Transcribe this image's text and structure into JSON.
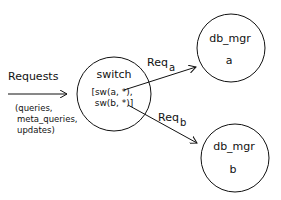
{
  "diagram": {
    "input": {
      "label": "Requests",
      "detail_lines": [
        "(queries,",
        "meta_queries,",
        "updates)"
      ]
    },
    "switch": {
      "title": "switch",
      "lines": [
        "[sw(a, *),",
        "sw(b, *)]"
      ]
    },
    "edges": [
      {
        "label": "Req",
        "subscript": "a",
        "to": "db_mgr_a"
      },
      {
        "label": "Req",
        "subscript": "b",
        "to": "db_mgr_b"
      }
    ],
    "nodes": [
      {
        "id": "db_mgr_a",
        "title": "db_mgr",
        "sub": "a"
      },
      {
        "id": "db_mgr_b",
        "title": "db_mgr",
        "sub": "b"
      }
    ],
    "colors": {
      "stroke": "#111111",
      "background": "#ffffff"
    }
  }
}
